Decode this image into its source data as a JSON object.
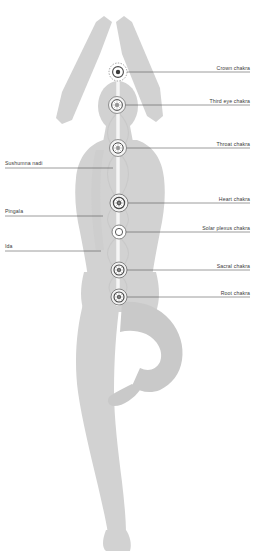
{
  "diagram": {
    "figure_name": "yoga-figure-tree-pose",
    "colors": {
      "body": "#d2d2d2",
      "body_shade": "#c6c6c6",
      "leader_line": "#4a4a4a",
      "nadi_line": "#c9c9c9",
      "sushumna": "#fdfdfd",
      "chakra_stroke": "#5a5a5a",
      "label_text": "#3a3a3a",
      "background": "#ffffff"
    },
    "labels_right": [
      {
        "id": "crown",
        "text": "Crown chakra",
        "y": 72,
        "text_x": 250,
        "text_y": 70,
        "line_x1": 122,
        "line_x2": 250
      },
      {
        "id": "third-eye",
        "text": "Third eye chakra",
        "y": 105,
        "text_x": 250,
        "text_y": 103,
        "line_x1": 120,
        "line_x2": 250
      },
      {
        "id": "throat",
        "text": "Throat chakra",
        "y": 148,
        "text_x": 250,
        "text_y": 146,
        "line_x1": 122,
        "line_x2": 250
      },
      {
        "id": "heart",
        "text": "Heart chakra",
        "y": 203,
        "text_x": 250,
        "text_y": 201,
        "line_x1": 123,
        "line_x2": 250
      },
      {
        "id": "solar-plexus",
        "text": "Solar plexus chakra",
        "y": 232,
        "text_x": 250,
        "text_y": 230,
        "line_x1": 123,
        "line_x2": 250
      },
      {
        "id": "sacral",
        "text": "Sacral chakra",
        "y": 270,
        "text_x": 250,
        "text_y": 268,
        "line_x1": 123,
        "line_x2": 250
      },
      {
        "id": "root",
        "text": "Root chakra",
        "y": 297,
        "text_x": 250,
        "text_y": 295,
        "line_x1": 123,
        "line_x2": 250
      }
    ],
    "labels_left": [
      {
        "id": "sushumna-nadi",
        "text": "Sushumna nadi",
        "y": 168,
        "text_x": 5,
        "text_y": 165,
        "line_x1": 5,
        "line_x2": 113
      },
      {
        "id": "pingala",
        "text": "Pingala",
        "y": 216,
        "text_x": 5,
        "text_y": 213,
        "line_x1": 5,
        "line_x2": 103
      },
      {
        "id": "ida",
        "text": "Ida",
        "y": 251,
        "text_x": 5,
        "text_y": 248,
        "line_x1": 5,
        "line_x2": 101
      }
    ],
    "chakras": [
      {
        "id": "crown",
        "cx": 118,
        "cy": 72,
        "r": 9.0,
        "style": "dotted-ring-solid-core"
      },
      {
        "id": "third-eye",
        "cx": 117,
        "cy": 105,
        "r": 8.5,
        "style": "petal-ring"
      },
      {
        "id": "throat",
        "cx": 118,
        "cy": 148,
        "r": 8.5,
        "style": "petal-ring"
      },
      {
        "id": "heart",
        "cx": 119,
        "cy": 203,
        "r": 9.0,
        "style": "petal-ring"
      },
      {
        "id": "solar-plexus",
        "cx": 119,
        "cy": 232,
        "r": 7.0,
        "style": "open-ring"
      },
      {
        "id": "sacral",
        "cx": 119,
        "cy": 270,
        "r": 8.0,
        "style": "petal-ring"
      },
      {
        "id": "root",
        "cx": 119,
        "cy": 297,
        "r": 8.0,
        "style": "petal-ring"
      }
    ],
    "channels": {
      "sushumna_x": 118,
      "sushumna_top": 64,
      "sushumna_bottom": 306,
      "ida_name": "ida-channel",
      "pingala_name": "pingala-channel"
    }
  }
}
